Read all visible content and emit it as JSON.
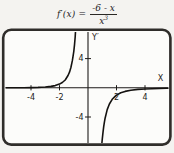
{
  "figure": {
    "formula": {
      "lhs": "f′(x) =",
      "fraction": {
        "numerator": "-6 - x",
        "denominator_base": "x",
        "denominator_exponent": "3"
      }
    }
  },
  "chart_data": {
    "type": "line",
    "x_axis_label": "X",
    "y_axis_label": "Y′",
    "x_window": [
      -6,
      6
    ],
    "y_window": [
      -7.6,
      7.6
    ],
    "grid": false,
    "x_ticks": [
      {
        "value": -4,
        "label": "-4"
      },
      {
        "value": -2,
        "label": "-2"
      },
      {
        "value": 2,
        "label": "2"
      },
      {
        "value": 4,
        "label": "4"
      }
    ],
    "y_ticks": [
      {
        "value": 4,
        "label": "4"
      },
      {
        "value": -4,
        "label": "-4"
      }
    ],
    "series": [
      {
        "name": "left-branch",
        "points": [
          [
            -6,
            0
          ],
          [
            -5.5,
            0.003
          ],
          [
            -5,
            0.008
          ],
          [
            -4.5,
            0.016
          ],
          [
            -4,
            0.031
          ],
          [
            -3.5,
            0.058
          ],
          [
            -3,
            0.111
          ],
          [
            -2.6,
            0.193
          ],
          [
            -2.3,
            0.304
          ],
          [
            -2,
            0.5
          ],
          [
            -1.8,
            0.72
          ],
          [
            -1.6,
            1.07
          ],
          [
            -1.4,
            1.68
          ],
          [
            -1.3,
            2.14
          ],
          [
            -1.2,
            2.78
          ],
          [
            -1.1,
            3.68
          ],
          [
            -1.05,
            4.27
          ],
          [
            -1,
            5
          ],
          [
            -0.95,
            5.89
          ],
          [
            -0.9,
            7
          ],
          [
            -0.877,
            7.7
          ]
        ]
      },
      {
        "name": "right-branch",
        "points": [
          [
            0.97,
            -7.7
          ],
          [
            1,
            -7
          ],
          [
            1.05,
            -6.09
          ],
          [
            1.1,
            -5.33
          ],
          [
            1.15,
            -4.7
          ],
          [
            1.2,
            -4.17
          ],
          [
            1.35,
            -2.99
          ],
          [
            1.5,
            -2.22
          ],
          [
            1.7,
            -1.57
          ],
          [
            1.9,
            -1.18
          ],
          [
            2,
            -1
          ],
          [
            2.3,
            -0.68
          ],
          [
            2.6,
            -0.49
          ],
          [
            3,
            -0.33
          ],
          [
            3.5,
            -0.22
          ],
          [
            4,
            -0.16
          ],
          [
            4.5,
            -0.12
          ],
          [
            5,
            -0.09
          ],
          [
            5.5,
            -0.07
          ],
          [
            6,
            -0.06
          ]
        ]
      }
    ]
  }
}
